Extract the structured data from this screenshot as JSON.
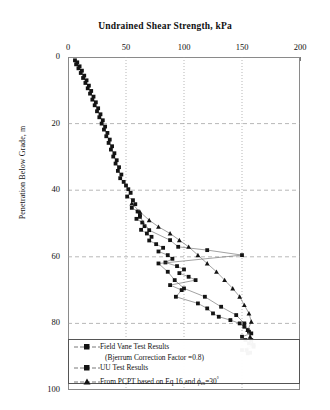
{
  "chart_data": {
    "type": "scatter",
    "title": "Undrained Shear Strength, kPa",
    "xlabel": "Undrained Shear Strength, kPa",
    "ylabel": "Penetration Below Grade, m",
    "xlim": [
      0,
      200
    ],
    "ylim": [
      0,
      100
    ],
    "y_inverted": true,
    "xticks": [
      0,
      50,
      100,
      150,
      200
    ],
    "yticks": [
      0,
      20,
      40,
      60,
      80,
      100
    ],
    "grid": "dotted vertical at 50,100,150; dashed horizontal at 20,40,60,80",
    "legend_position": "bottom-inside",
    "series": [
      {
        "name": "Field Vane Test Results",
        "marker": "square",
        "connected": true,
        "points": [
          [
            6,
            1.0
          ],
          [
            8,
            1.6
          ],
          [
            7,
            2.2
          ],
          [
            10,
            2.8
          ],
          [
            9,
            3.4
          ],
          [
            12,
            4.1
          ],
          [
            11,
            4.8
          ],
          [
            14,
            5.6
          ],
          [
            13,
            6.3
          ],
          [
            16,
            7.0
          ],
          [
            15,
            7.8
          ],
          [
            18,
            8.6
          ],
          [
            17,
            9.4
          ],
          [
            20,
            10.2
          ],
          [
            19,
            11.0
          ],
          [
            22,
            11.9
          ],
          [
            21,
            12.8
          ],
          [
            24,
            13.6
          ],
          [
            23,
            14.5
          ],
          [
            26,
            15.4
          ],
          [
            25,
            16.3
          ],
          [
            28,
            17.2
          ],
          [
            27,
            18.1
          ],
          [
            30,
            19.0
          ],
          [
            29,
            20.0
          ],
          [
            32,
            20.9
          ],
          [
            31,
            21.8
          ],
          [
            34,
            22.8
          ],
          [
            33,
            23.8
          ],
          [
            36,
            24.8
          ],
          [
            35,
            25.8
          ],
          [
            38,
            26.8
          ],
          [
            37,
            27.8
          ],
          [
            40,
            28.9
          ],
          [
            39,
            29.9
          ],
          [
            42,
            31.0
          ],
          [
            41,
            32.0
          ],
          [
            44,
            33.1
          ],
          [
            43,
            34.2
          ],
          [
            46,
            35.3
          ],
          [
            45,
            36.4
          ],
          [
            48,
            37.5
          ],
          [
            50,
            38.6
          ],
          [
            52,
            39.7
          ],
          [
            54,
            40.8
          ],
          [
            51,
            41.9
          ],
          [
            56,
            43.0
          ],
          [
            58,
            44.2
          ],
          [
            55,
            45.3
          ],
          [
            60,
            46.4
          ],
          [
            62,
            47.5
          ],
          [
            59,
            48.6
          ],
          [
            64,
            49.7
          ],
          [
            66,
            50.8
          ],
          [
            63,
            51.9
          ],
          [
            68,
            53.0
          ],
          [
            72,
            54.0
          ],
          [
            70,
            55.1
          ],
          [
            76,
            56.2
          ],
          [
            82,
            57.3
          ],
          [
            78,
            58.4
          ],
          [
            86,
            59.5
          ],
          [
            90,
            60.6
          ],
          [
            84,
            61.7
          ],
          [
            94,
            62.8
          ],
          [
            100,
            63.8
          ],
          [
            96,
            64.9
          ],
          [
            104,
            66.0
          ],
          [
            110,
            67.0
          ],
          [
            88,
            68.5
          ],
          [
            98,
            70.0
          ],
          [
            93,
            72.0
          ],
          [
            112,
            74.0
          ],
          [
            120,
            75.5
          ],
          [
            125,
            77.0
          ],
          [
            130,
            78.0
          ],
          [
            140,
            79.0
          ],
          [
            148,
            80.0
          ],
          [
            152,
            81.0
          ],
          [
            155,
            82.0
          ],
          [
            158,
            83.0
          ],
          [
            150,
            84.0
          ],
          [
            153,
            85.0
          ],
          [
            156,
            86.0
          ],
          [
            160,
            87.0
          ],
          [
            154,
            88.0
          ],
          [
            157,
            88.8
          ]
        ]
      },
      {
        "name": "UU Test Results",
        "marker": "square",
        "connected": true,
        "points": [
          [
            62,
            48.0
          ],
          [
            70,
            52.0
          ],
          [
            88,
            55.0
          ],
          [
            95,
            57.0
          ],
          [
            120,
            58.0
          ],
          [
            150,
            59.5
          ],
          [
            78,
            62.0
          ],
          [
            86,
            64.5
          ],
          [
            92,
            67.0
          ],
          [
            100,
            69.5
          ],
          [
            118,
            72.0
          ],
          [
            132,
            75.0
          ],
          [
            145,
            77.5
          ],
          [
            152,
            80.0
          ],
          [
            156,
            82.5
          ],
          [
            158,
            85.0
          ],
          [
            160,
            86.5
          ],
          [
            150,
            88.0
          ],
          [
            155,
            89.0
          ]
        ]
      },
      {
        "name": "From PCPT based on Eq 16 and phi_cs = 30 deg",
        "marker": "triangle",
        "connected": true,
        "points": [
          [
            55,
            44.0
          ],
          [
            62,
            46.5
          ],
          [
            70,
            49.0
          ],
          [
            78,
            51.0
          ],
          [
            88,
            53.0
          ],
          [
            96,
            55.0
          ],
          [
            104,
            57.0
          ],
          [
            112,
            59.5
          ],
          [
            120,
            62.0
          ],
          [
            128,
            64.5
          ],
          [
            135,
            67.0
          ],
          [
            142,
            69.5
          ],
          [
            148,
            72.0
          ],
          [
            152,
            74.5
          ],
          [
            156,
            77.0
          ],
          [
            158,
            79.5
          ],
          [
            155,
            82.0
          ],
          [
            157,
            84.0
          ],
          [
            159,
            86.0
          ]
        ]
      }
    ]
  },
  "axes": {
    "x_ticks": [
      {
        "label": "0",
        "value": 0
      },
      {
        "label": "50",
        "value": 50
      },
      {
        "label": "100",
        "value": 100
      },
      {
        "label": "150",
        "value": 150
      },
      {
        "label": "200",
        "value": 200
      }
    ],
    "y_ticks": [
      {
        "label": "0",
        "value": 0
      },
      {
        "label": "20",
        "value": 20
      },
      {
        "label": "40",
        "value": 40
      },
      {
        "label": "60",
        "value": 60
      },
      {
        "label": "80",
        "value": 80
      },
      {
        "label": "100",
        "value": 100
      }
    ],
    "y_axis_title": "Penetration Below Grade, m"
  },
  "legend": {
    "entries": [
      {
        "marker": "square",
        "label": "Field Vane Test Results"
      },
      {
        "marker": "none",
        "label": "(Bjerrum Correction Factor =0.8)"
      },
      {
        "marker": "square",
        "label": "UU Test Results"
      },
      {
        "marker": "triangle",
        "label": "From PCPT based on Eq 16 and "
      }
    ],
    "phi_symbol": "ϕ",
    "phi_subscript": "cs",
    "phi_value": "=30",
    "phi_degree": "°"
  },
  "colors": {
    "marker": "#141414",
    "line": "#555555",
    "frame": "#8a8a8a",
    "grid": "#9a9a9a",
    "background": "#ffffff"
  }
}
